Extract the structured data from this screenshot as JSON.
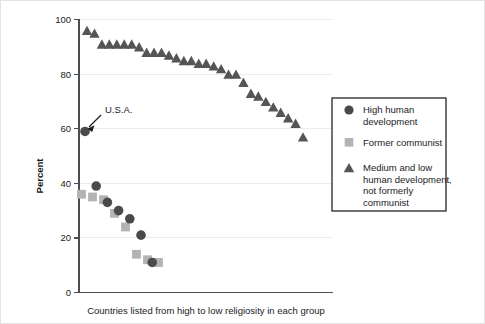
{
  "chart_data": {
    "type": "scatter",
    "title": "",
    "xlabel": "Countries listed from high to low religiosity in each group",
    "ylabel": "Percent",
    "ylim": [
      0,
      100
    ],
    "yticks": [
      0,
      20,
      40,
      60,
      80,
      100
    ],
    "ytick_labels": [
      "0",
      "20",
      "40",
      "60",
      "80",
      "100"
    ],
    "xticks": [],
    "xtick_labels": [],
    "grid": "horizontal",
    "legend_position": "right",
    "annotations": [
      {
        "text": "U.S.A.",
        "points_to_series": "High human development",
        "points_to_index": 0,
        "value": 59
      }
    ],
    "series": [
      {
        "name": "High human development",
        "marker": "circle",
        "color": "#4a4a4a",
        "x": [
          1,
          2,
          3,
          4,
          5,
          6,
          7
        ],
        "values": [
          59,
          39,
          33,
          30,
          27,
          21,
          11
        ]
      },
      {
        "name": "Former communist",
        "marker": "square",
        "color": "#b3b3b3",
        "x": [
          1,
          2,
          3,
          4,
          5,
          6,
          7,
          8
        ],
        "values": [
          36,
          35,
          34,
          29,
          24,
          14,
          12,
          11
        ]
      },
      {
        "name": "Medium and low human development, not formerly communist",
        "marker": "triangle",
        "color": "#555555",
        "x": [
          1,
          2,
          3,
          4,
          5,
          6,
          7,
          8,
          9,
          10,
          11,
          12,
          13,
          14,
          15,
          16,
          17,
          18,
          19,
          20,
          21,
          22,
          23,
          24,
          25,
          26,
          27,
          28,
          29,
          30
        ],
        "values": [
          96,
          95,
          91,
          91,
          91,
          91,
          91,
          90,
          88,
          88,
          88,
          87,
          86,
          85,
          85,
          84,
          84,
          83,
          82,
          80,
          80,
          77,
          73,
          72,
          70,
          68,
          66,
          64,
          62,
          57
        ]
      }
    ]
  },
  "axis": {
    "y_title": "Percent",
    "y_tick_100": "100",
    "y_tick_80": "80",
    "y_tick_60": "60",
    "y_tick_40": "40",
    "y_tick_20": "20",
    "y_tick_0": "0",
    "x_caption": "Countries listed from high to low religiosity in each group"
  },
  "annotation": {
    "usa_label": "U.S.A."
  },
  "legend": {
    "items": [
      {
        "label_line1": "High human",
        "label_line2": "development",
        "label_line3": "",
        "label_line4": "",
        "marker": "circle-marker"
      },
      {
        "label_line1": "Former communist",
        "label_line2": "",
        "label_line3": "",
        "label_line4": "",
        "marker": "square-marker"
      },
      {
        "label_line1": "Medium and low",
        "label_line2": "human development,",
        "label_line3": "not formerly",
        "label_line4": "communist",
        "marker": "triangle-marker"
      }
    ]
  },
  "colors": {
    "circle": "#4a4a4a",
    "square": "#b3b3b3",
    "triangle": "#555555",
    "grid": "#ebebeb",
    "axis": "#4d4d4d",
    "frame": "#e3e3e3"
  }
}
